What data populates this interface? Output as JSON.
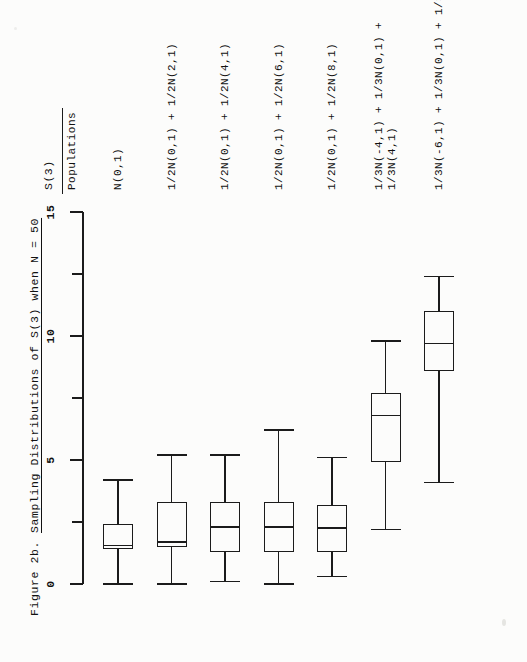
{
  "figure": {
    "number": "Figure 2b.",
    "title": "Sampling Distributions of S(3) when N = 50",
    "axis_name": "S(3)",
    "category_header": "Populations"
  },
  "chart_data": {
    "type": "box",
    "title": "Sampling Distributions of S(3) when N = 50",
    "orientation": "horizontal-page-rotated",
    "xlabel": "Populations",
    "ylabel": "S(3)",
    "ylim": [
      0,
      15
    ],
    "yticks": [
      0,
      2.5,
      5,
      7.5,
      10,
      12.5,
      15
    ],
    "ytick_labels": [
      "0",
      "",
      "5",
      "",
      "10",
      "",
      "15"
    ],
    "grid": false,
    "legend": "none",
    "categories": [
      "N(0,1)",
      "1/2N(0,1) + 1/2N(2,1)",
      "1/2N(0,1) + 1/2N(4,1)",
      "1/2N(0,1) + 1/2N(6,1)",
      "1/2N(0,1) + 1/2N(8,1)",
      "1/3N(-4,1) + 1/3N(0,1) + 1/3N(4,1)",
      "1/3N(-6,1) + 1/3N(0,1) + 1/3N(6,1)"
    ],
    "category_lines": [
      [
        "N(0,1)"
      ],
      [
        "1/2N(0,1) + 1/2N(2,1)"
      ],
      [
        "1/2N(0,1) + 1/2N(4,1)"
      ],
      [
        "1/2N(0,1) + 1/2N(6,1)"
      ],
      [
        "1/2N(0,1) + 1/2N(8,1)"
      ],
      [
        "1/3N(-4,1) + 1/3N(0,1) +",
        "1/3N(4,1)"
      ],
      [
        "1/3N(-6,1) + 1/3N(0,1) + 1/3N(6,1)"
      ]
    ],
    "boxes": [
      {
        "label": "N(0,1)",
        "whisker_low": 0.0,
        "q1": 1.4,
        "median": 1.55,
        "q3": 2.4,
        "whisker_high": 4.2
      },
      {
        "label": "1/2N(0,1) + 1/2N(2,1)",
        "whisker_low": 0.0,
        "q1": 1.5,
        "median": 1.7,
        "q3": 3.3,
        "whisker_high": 5.2
      },
      {
        "label": "1/2N(0,1) + 1/2N(4,1)",
        "whisker_low": 0.1,
        "q1": 1.3,
        "median": 2.3,
        "q3": 3.3,
        "whisker_high": 5.2
      },
      {
        "label": "1/2N(0,1) + 1/2N(6,1)",
        "whisker_low": 0.0,
        "q1": 1.3,
        "median": 2.3,
        "q3": 3.3,
        "whisker_high": 6.2
      },
      {
        "label": "1/2N(0,1) + 1/2N(8,1)",
        "whisker_low": 0.3,
        "q1": 1.3,
        "median": 2.25,
        "q3": 3.2,
        "whisker_high": 5.1
      },
      {
        "label": "1/3N(-4,1) + 1/3N(0,1) + 1/3N(4,1)",
        "whisker_low": 2.2,
        "q1": 4.9,
        "median": 6.8,
        "q3": 7.7,
        "whisker_high": 9.8
      },
      {
        "label": "1/3N(-6,1) + 1/3N(0,1) + 1/3N(6,1)",
        "whisker_low": 4.1,
        "q1": 8.6,
        "median": 9.7,
        "q3": 11.0,
        "whisker_high": 12.4
      }
    ]
  },
  "colors": {
    "ink": "#1b1b1b",
    "paper": "#fcfcfb"
  }
}
